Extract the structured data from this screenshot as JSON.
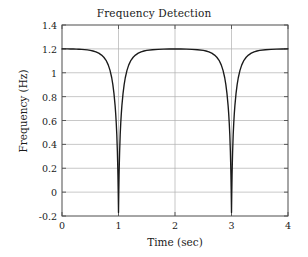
{
  "chart_data": {
    "type": "line",
    "title": "Frequency Detection",
    "xlabel": "Time (sec)",
    "ylabel": "Frequency (Hz)",
    "xlim": [
      0,
      4
    ],
    "ylim": [
      -0.2,
      1.4
    ],
    "grid": true,
    "legend": null,
    "xticks": [
      "0",
      "1",
      "2",
      "3",
      "4"
    ],
    "xtick_values": [
      0,
      1,
      2,
      3,
      4
    ],
    "yticks": [
      "-0.2",
      "0",
      "0.2",
      "0.4",
      "0.6",
      "0.8",
      "1",
      "1.2",
      "1.4"
    ],
    "ytick_values": [
      -0.2,
      0,
      0.2,
      0.4,
      0.6,
      0.8,
      1,
      1.2,
      1.4
    ],
    "line_color": "#1a1a1a",
    "grid_color": "#b0b0b0",
    "axis_color": "#4d4d4d",
    "baseline_value": 1.2,
    "dip_centers": [
      1.0,
      3.0
    ],
    "dip_minimum": -0.17,
    "annotations": [],
    "series": [
      {
        "name": "frequency",
        "x": [
          0.0,
          0.05,
          0.1,
          0.15,
          0.2,
          0.25,
          0.3,
          0.35,
          0.4,
          0.45,
          0.5,
          0.55,
          0.6,
          0.65,
          0.7,
          0.74,
          0.78,
          0.82,
          0.85,
          0.88,
          0.9,
          0.92,
          0.94,
          0.95,
          0.96,
          0.97,
          0.98,
          0.985,
          0.99,
          0.995,
          1.0,
          1.005,
          1.01,
          1.015,
          1.02,
          1.03,
          1.04,
          1.05,
          1.06,
          1.08,
          1.1,
          1.12,
          1.15,
          1.18,
          1.22,
          1.26,
          1.3,
          1.35,
          1.4,
          1.45,
          1.5,
          1.6,
          1.7,
          1.8,
          1.9,
          2.0,
          2.1,
          2.2,
          2.3,
          2.4,
          2.5,
          2.55,
          2.6,
          2.65,
          2.7,
          2.74,
          2.78,
          2.82,
          2.85,
          2.88,
          2.9,
          2.92,
          2.94,
          2.95,
          2.96,
          2.97,
          2.98,
          2.985,
          2.99,
          2.995,
          3.0,
          3.005,
          3.01,
          3.015,
          3.02,
          3.03,
          3.04,
          3.05,
          3.06,
          3.08,
          3.1,
          3.12,
          3.15,
          3.18,
          3.22,
          3.26,
          3.3,
          3.35,
          3.4,
          3.45,
          3.5,
          3.6,
          3.7,
          3.8,
          3.9,
          4.0
        ],
        "y": [
          1.2,
          1.2,
          1.2,
          1.199,
          1.199,
          1.198,
          1.197,
          1.196,
          1.194,
          1.191,
          1.187,
          1.182,
          1.175,
          1.164,
          1.148,
          1.13,
          1.104,
          1.064,
          1.02,
          0.958,
          0.9,
          0.825,
          0.725,
          0.66,
          0.58,
          0.48,
          0.34,
          0.25,
          0.14,
          0.0,
          -0.17,
          0.0,
          0.14,
          0.25,
          0.34,
          0.48,
          0.58,
          0.66,
          0.725,
          0.825,
          0.9,
          0.958,
          1.02,
          1.064,
          1.104,
          1.13,
          1.148,
          1.164,
          1.175,
          1.182,
          1.187,
          1.193,
          1.196,
          1.198,
          1.199,
          1.2,
          1.199,
          1.198,
          1.196,
          1.193,
          1.187,
          1.182,
          1.175,
          1.164,
          1.148,
          1.13,
          1.104,
          1.064,
          1.02,
          0.958,
          0.9,
          0.825,
          0.725,
          0.66,
          0.58,
          0.48,
          0.34,
          0.25,
          0.14,
          0.0,
          -0.17,
          0.0,
          0.14,
          0.25,
          0.34,
          0.48,
          0.58,
          0.66,
          0.725,
          0.825,
          0.9,
          0.958,
          1.02,
          1.064,
          1.104,
          1.13,
          1.148,
          1.164,
          1.175,
          1.182,
          1.187,
          1.193,
          1.196,
          1.198,
          1.199,
          1.2
        ]
      }
    ]
  }
}
